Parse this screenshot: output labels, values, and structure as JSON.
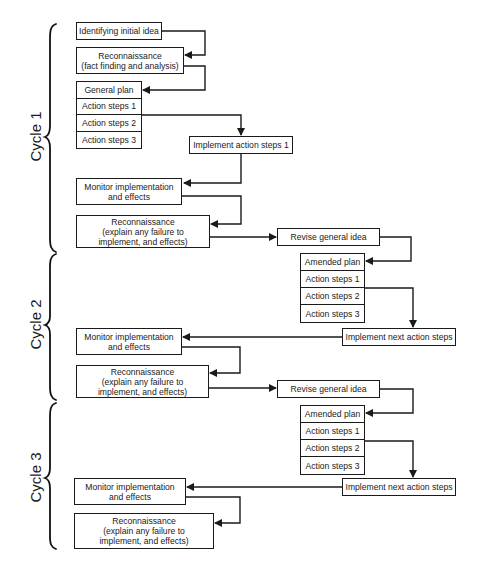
{
  "cycles": [
    {
      "label": "Cycle 1"
    },
    {
      "label": "Cycle 2"
    },
    {
      "label": "Cycle 3"
    }
  ],
  "cycle1": {
    "initial_idea": "Identifying initial idea",
    "recon_title": "Reconnaissance",
    "recon_sub": "(fact finding and analysis)",
    "plan": [
      "General plan",
      "Action steps 1",
      "Action steps 2",
      "Action steps 3"
    ],
    "implement": "Implement action steps 1",
    "monitor_l1": "Monitor implementation",
    "monitor_l2": "and effects",
    "recon2_title": "Reconnaissance",
    "recon2_l1": "(explain any failure to",
    "recon2_l2": "implement, and effects)",
    "revise": "Revise general idea"
  },
  "cycle2": {
    "plan": [
      "Amended plan",
      "Action steps 1",
      "Action steps 2",
      "Action steps 3"
    ],
    "implement": "Implement next action steps",
    "monitor_l1": "Monitor implementation",
    "monitor_l2": "and effects",
    "recon_title": "Reconnaissance",
    "recon_l1": "(explain any failure to",
    "recon_l2": "implement, and effects)",
    "revise": "Revise general idea"
  },
  "cycle3": {
    "plan": [
      "Amended plan",
      "Action steps 1",
      "Action steps 2",
      "Action steps 3"
    ],
    "implement": "Implement next action steps",
    "monitor_l1": "Monitor implementation",
    "monitor_l2": "and effects",
    "recon_title": "Reconnaissance",
    "recon_l1": "(explain any failure to",
    "recon_l2": "implement, and effects)"
  },
  "colors": {
    "line": "#1a1a1a",
    "background": "#ffffff"
  }
}
